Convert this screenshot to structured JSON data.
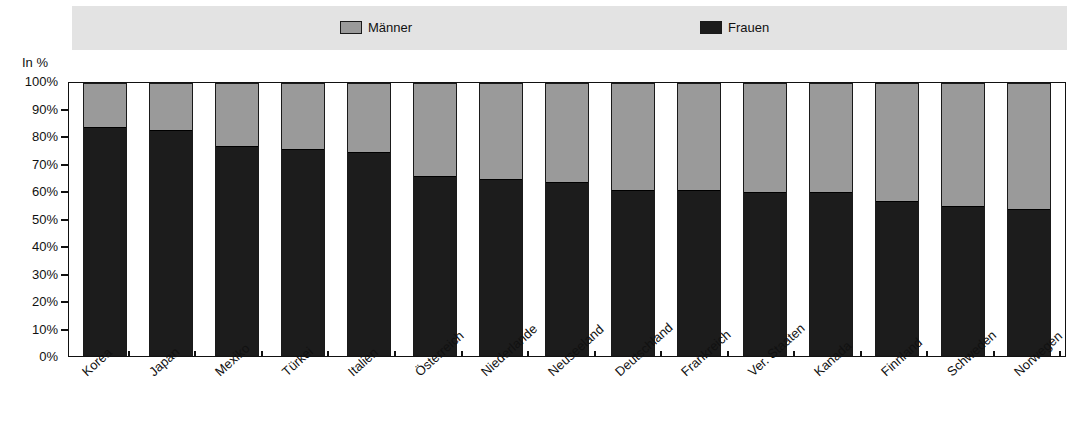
{
  "legend": {
    "items": [
      {
        "label": "Männer",
        "color": "#9a9a9a",
        "key": "men"
      },
      {
        "label": "Frauen",
        "color": "#1c1c1c",
        "key": "women"
      }
    ]
  },
  "axis": {
    "unit_label": "In %",
    "y_ticks": [
      "100%",
      "90%",
      "80%",
      "70%",
      "60%",
      "50%",
      "40%",
      "30%",
      "20%",
      "10%",
      "0%"
    ]
  },
  "chart_data": {
    "type": "bar",
    "title": "",
    "subtitle": "",
    "xlabel": "",
    "ylabel": "In %",
    "ylim": [
      0,
      100
    ],
    "stacked": true,
    "stack_total": 100,
    "grid": false,
    "legend_position": "top",
    "categories": [
      "Korea",
      "Japan",
      "Mexiko",
      "Türkei",
      "Italien",
      "Österreich",
      "Niederlande",
      "Neuseeland",
      "Deutschland",
      "Frankreich",
      "Ver. Staaten",
      "Kanada",
      "Finnland",
      "Schweden",
      "Norwegen"
    ],
    "series": [
      {
        "name": "Frauen",
        "color": "#1c1c1c",
        "values": [
          84,
          83,
          77,
          76,
          75,
          66,
          65,
          64,
          61,
          61,
          60,
          60,
          57,
          55,
          54
        ]
      },
      {
        "name": "Männer",
        "color": "#9a9a9a",
        "values": [
          16,
          17,
          23,
          24,
          25,
          34,
          35,
          36,
          39,
          39,
          40,
          40,
          43,
          45,
          46
        ]
      }
    ]
  }
}
